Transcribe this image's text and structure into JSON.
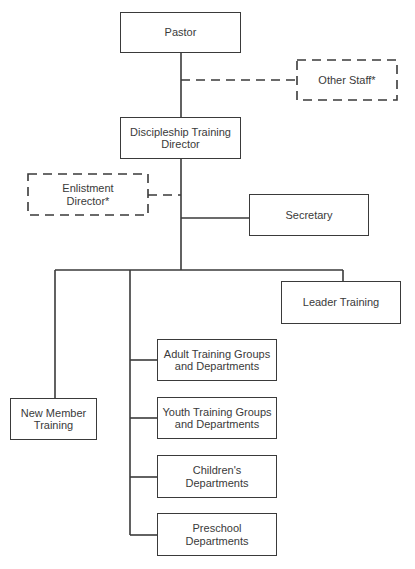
{
  "diagram": {
    "type": "org-chart",
    "nodes": {
      "pastor": {
        "label": "Pastor"
      },
      "other_staff": {
        "label": "Other Staff*",
        "style": "dashed"
      },
      "dt_director": {
        "line1": "Discipleship Training",
        "line2": "Director"
      },
      "enlistment": {
        "line1": "Enlistment",
        "line2": "Director*",
        "style": "dashed"
      },
      "secretary": {
        "label": "Secretary"
      },
      "leader_training": {
        "label": "Leader Training"
      },
      "new_member": {
        "line1": "New Member",
        "line2": "Training"
      },
      "adult": {
        "line1": "Adult Training Groups",
        "line2": "and Departments"
      },
      "youth": {
        "line1": "Youth Training Groups",
        "line2": "and Departments"
      },
      "children": {
        "line1": "Children's",
        "line2": "Departments"
      },
      "preschool": {
        "line1": "Preschool",
        "line2": "Departments"
      }
    },
    "edges": [
      {
        "from": "pastor",
        "to": "dt_director",
        "style": "solid"
      },
      {
        "from": "pastor",
        "to": "other_staff",
        "style": "dashed"
      },
      {
        "from": "dt_director",
        "to": "enlistment",
        "style": "dashed"
      },
      {
        "from": "dt_director",
        "to": "secretary",
        "style": "solid"
      },
      {
        "from": "dt_director",
        "to": "leader_training",
        "style": "solid"
      },
      {
        "from": "dt_director",
        "to": "new_member",
        "style": "solid"
      },
      {
        "from": "dt_director",
        "to": "adult",
        "style": "solid"
      },
      {
        "from": "dt_director",
        "to": "youth",
        "style": "solid"
      },
      {
        "from": "dt_director",
        "to": "children",
        "style": "solid"
      },
      {
        "from": "dt_director",
        "to": "preschool",
        "style": "solid"
      }
    ],
    "colors": {
      "line": "#3a3a3a",
      "background": "#ffffff"
    }
  }
}
